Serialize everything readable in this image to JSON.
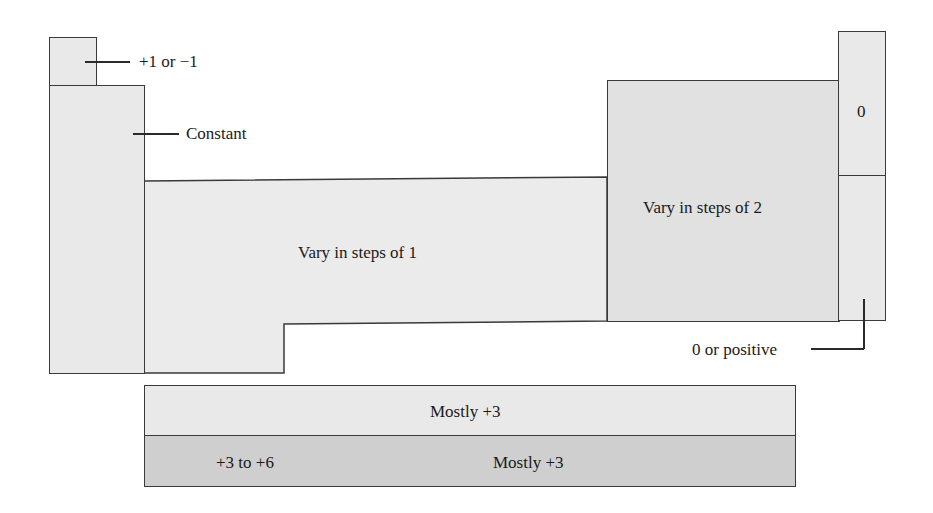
{
  "diagram": {
    "type": "periodic-table-oxidation-state-regions",
    "regions": [
      {
        "id": "hydrogen",
        "label": "+1 or −1"
      },
      {
        "id": "s-block",
        "label": "Constant"
      },
      {
        "id": "d-block",
        "label": "Vary in steps of 1"
      },
      {
        "id": "p-block",
        "label": "Vary in steps of 2"
      },
      {
        "id": "noble-gas-upper",
        "label": "0"
      },
      {
        "id": "noble-gas-lower",
        "label": "0 or positive"
      },
      {
        "id": "lanthanides",
        "label": "Mostly +3"
      },
      {
        "id": "actinides-early",
        "label": "+3 to +6"
      },
      {
        "id": "actinides-late",
        "label": "Mostly +3"
      }
    ]
  },
  "colors": {
    "light_fill": "#e9e9e9",
    "mid_fill": "#e1e1e1",
    "dark_fill": "#cfcfcf",
    "border": "#3a3a3a"
  }
}
